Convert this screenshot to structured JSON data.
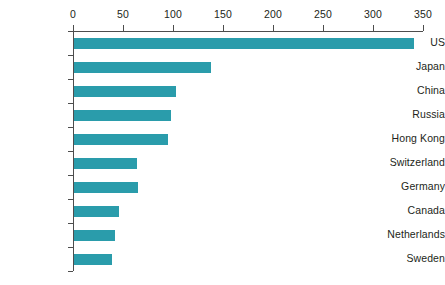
{
  "chart_data": {
    "type": "bar",
    "orientation": "horizontal",
    "title": "",
    "subtitle": "",
    "xlabel": "",
    "ylabel": "",
    "categories": [
      "US",
      "Japan",
      "China",
      "Russia",
      "Hong Kong",
      "Switzerland",
      "Germany",
      "Canada",
      "Netherlands",
      "Sweden"
    ],
    "values": [
      340,
      137,
      102,
      97,
      94,
      63,
      64,
      45,
      41,
      38
    ],
    "series": [
      {
        "name": "",
        "values": [
          340,
          137,
          102,
          97,
          94,
          63,
          64,
          45,
          41,
          38
        ]
      }
    ],
    "xlim": [
      0,
      350
    ],
    "ylim": null,
    "xticks": [
      0,
      50,
      100,
      150,
      200,
      250,
      300,
      350
    ],
    "xtick_labels": [
      "0",
      "50",
      "100",
      "150",
      "200",
      "250",
      "300",
      "350"
    ],
    "grid": false,
    "legend": false,
    "legend_position": "none",
    "annotations": [],
    "colors": {
      "bar": "#2a9cab",
      "axis": "#4d4d4d",
      "text": "#231f20",
      "background": "#ffffff"
    },
    "axis_position": "top"
  }
}
